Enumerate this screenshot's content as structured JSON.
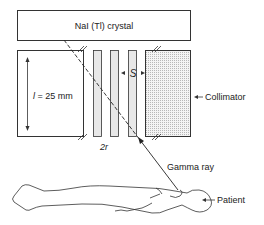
{
  "diagram": {
    "crystal_label": "NaI (Tl) crystal",
    "length_label_var": "l",
    "length_label_value": " = 25 mm",
    "septa_spacing_label": "S",
    "hole_label": "2r",
    "collimator_label": "Collimator",
    "gamma_label": "Gamma ray",
    "patient_label": "Patient"
  }
}
